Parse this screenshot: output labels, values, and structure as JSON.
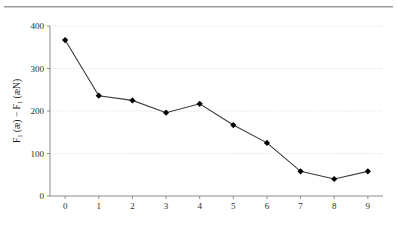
{
  "figure": {
    "top_rule": "horizontal-rule",
    "background_color": "#ffffff",
    "axis_color": "#8c8c8c",
    "grid_color": "#dcdcdc",
    "line_color": "#3a3a3a",
    "marker_color": "#000000"
  },
  "chart_data": {
    "type": "line",
    "title": "",
    "xlabel": "Age in Decades",
    "ylabel": "F1 (æ) − F1 (æN)",
    "ylabel_parts": {
      "f_main": "F",
      "f_sub": "1",
      "open_1": " (æ) − ",
      "f_main2": "F",
      "f_sub2": "1",
      "open_2": " (æN)"
    },
    "x": [
      0,
      1,
      2,
      3,
      4,
      5,
      6,
      7,
      8,
      9
    ],
    "values": [
      367,
      236,
      225,
      196,
      217,
      167,
      125,
      58,
      40,
      58
    ],
    "categories": [
      "0",
      "1",
      "2",
      "3",
      "4",
      "5",
      "6",
      "7",
      "8",
      "9"
    ],
    "xtick_labels": [
      "0",
      "1",
      "2",
      "3",
      "4",
      "5",
      "6",
      "7",
      "8",
      "9"
    ],
    "ytick_labels": [
      "0",
      "100",
      "200",
      "300",
      "400"
    ],
    "ytick_values": [
      0,
      100,
      200,
      300,
      400
    ],
    "xlim": [
      -0.45,
      9.45
    ],
    "ylim": [
      0,
      400
    ],
    "grid": "horizontal-dotted",
    "legend": "none",
    "marker": "diamond"
  }
}
